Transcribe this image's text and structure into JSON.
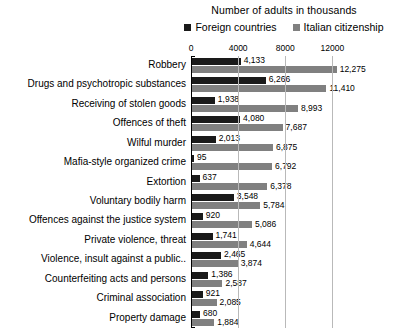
{
  "chart_data": {
    "type": "bar",
    "orientation": "horizontal",
    "title": "Number of adults in thousands",
    "xlabel": "",
    "ylabel": "",
    "xlim": [
      0,
      14000
    ],
    "xticks": [
      0,
      4000,
      8000,
      12000
    ],
    "xtick_labels": [
      "0",
      "4000",
      "8000",
      "12000"
    ],
    "grid": true,
    "legend_position": "top",
    "categories": [
      "Robbery",
      "Drugs and psychotropic substances",
      "Receiving of stolen goods",
      "Offences of theft",
      "Wilful murder",
      "Mafia-style organized crime",
      "Extortion",
      "Voluntary bodily harm",
      "Offences against the justice system",
      "Private violence, threat",
      "Violence, insult against a public..",
      "Counterfeiting acts and persons",
      "Criminal association",
      "Property damage"
    ],
    "series": [
      {
        "name": "Foreign countries",
        "color": "#1a1a1a",
        "values": [
          4133,
          6266,
          1938,
          4080,
          2013,
          95,
          637,
          3548,
          920,
          1741,
          2465,
          1386,
          921,
          680
        ],
        "labels": [
          "4,133",
          "6,266",
          "1,938",
          "4,080",
          "2,013",
          "95",
          "637",
          "3,548",
          "920",
          "1,741",
          "2,465",
          "1,386",
          "921",
          "680"
        ]
      },
      {
        "name": "Italian citizenship",
        "color": "#808080",
        "values": [
          12275,
          11410,
          8993,
          7687,
          6875,
          6792,
          6378,
          5784,
          5086,
          4644,
          3874,
          2587,
          2085,
          1884
        ],
        "labels": [
          "12,275",
          "11,410",
          "8,993",
          "7,687",
          "6,875",
          "6,792",
          "6,378",
          "5,784",
          "5,086",
          "4,644",
          "3,874",
          "2,587",
          "2,085",
          "1,884"
        ]
      }
    ]
  }
}
